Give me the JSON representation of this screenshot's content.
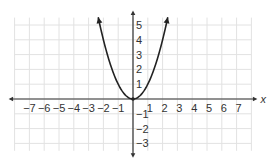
{
  "chart_data": {
    "type": "line",
    "title": "",
    "xlabel": "x",
    "ylabel": "",
    "function": "y = x^2",
    "xlim": [
      -8,
      8
    ],
    "ylim": [
      -3.5,
      5.5
    ],
    "grid": true,
    "legend": null,
    "x_tick_labels": [
      "-7",
      "-6",
      "-5",
      "-4",
      "-3",
      "-2",
      "-1",
      "1",
      "2",
      "3",
      "4",
      "5",
      "6",
      "7"
    ],
    "y_tick_labels": [
      "5",
      "4",
      "3",
      "2",
      "1",
      "-1",
      "-2",
      "-3"
    ],
    "series": [
      {
        "name": "parabola",
        "x": [
          -2.35,
          -2,
          -1.5,
          -1,
          -0.5,
          0,
          0.5,
          1,
          1.5,
          2,
          2.35
        ],
        "y": [
          5.52,
          4,
          2.25,
          1,
          0.25,
          0,
          0.25,
          1,
          2.25,
          4,
          5.52
        ],
        "arrows": "both ends"
      }
    ],
    "vertex": [
      0,
      0
    ]
  }
}
